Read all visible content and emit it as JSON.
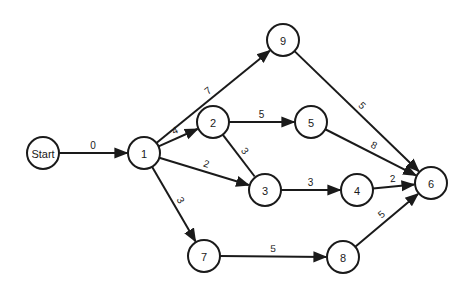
{
  "diagram": {
    "type": "network-activity-graph",
    "node_radius": 16,
    "colors": {
      "stroke": "#1a1a1a",
      "fill": "#ffffff",
      "background": "#ffffff"
    },
    "nodes": [
      {
        "id": "start",
        "label": "Start",
        "x": 43,
        "y": 153
      },
      {
        "id": "1",
        "label": "1",
        "x": 144,
        "y": 153
      },
      {
        "id": "2",
        "label": "2",
        "x": 213,
        "y": 122
      },
      {
        "id": "3",
        "label": "3",
        "x": 265,
        "y": 190
      },
      {
        "id": "4",
        "label": "4",
        "x": 357,
        "y": 190
      },
      {
        "id": "5",
        "label": "5",
        "x": 311,
        "y": 122
      },
      {
        "id": "6",
        "label": "6",
        "x": 431,
        "y": 183
      },
      {
        "id": "7",
        "label": "7",
        "x": 204,
        "y": 256
      },
      {
        "id": "8",
        "label": "8",
        "x": 343,
        "y": 257
      },
      {
        "id": "9",
        "label": "9",
        "x": 283,
        "y": 40
      }
    ],
    "edges": [
      {
        "from": "start",
        "to": "1",
        "weight": "0",
        "arrow": true
      },
      {
        "from": "1",
        "to": "9",
        "weight": "7",
        "arrow": true
      },
      {
        "from": "1",
        "to": "2",
        "weight": "4",
        "arrow": true
      },
      {
        "from": "1",
        "to": "3",
        "weight": "2",
        "arrow": true
      },
      {
        "from": "1",
        "to": "7",
        "weight": "3",
        "arrow": true
      },
      {
        "from": "2",
        "to": "5",
        "weight": "5",
        "arrow": true
      },
      {
        "from": "2",
        "to": "3",
        "weight": "3",
        "arrow": false
      },
      {
        "from": "3",
        "to": "4",
        "weight": "3",
        "arrow": true
      },
      {
        "from": "4",
        "to": "6",
        "weight": "2",
        "arrow": true
      },
      {
        "from": "5",
        "to": "6",
        "weight": "8",
        "arrow": true
      },
      {
        "from": "9",
        "to": "6",
        "weight": "5",
        "arrow": true
      },
      {
        "from": "7",
        "to": "8",
        "weight": "5",
        "arrow": true
      },
      {
        "from": "8",
        "to": "6",
        "weight": "5",
        "arrow": true
      }
    ]
  }
}
